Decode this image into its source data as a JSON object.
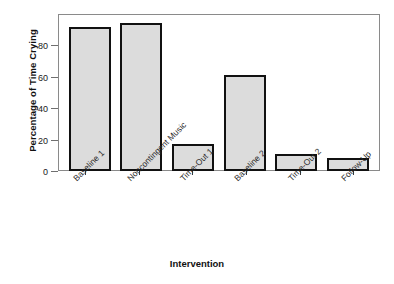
{
  "chart_data": {
    "type": "bar",
    "title": "",
    "xlabel": "Intervention",
    "ylabel": "Percentage of Time Crying",
    "categories": [
      "Baseline 1",
      "Noncontingent Music",
      "Time-Out 1",
      "Baseline 2",
      "Time-Out 2",
      "Follow-Up"
    ],
    "values": [
      92,
      94,
      17,
      61,
      11,
      8
    ],
    "ylim": [
      0,
      100
    ],
    "yticks": [
      0,
      20,
      40,
      60,
      80
    ],
    "ytick_labels": [
      "0",
      "20",
      "40",
      "60",
      "80"
    ],
    "grid": false,
    "legend": false,
    "bar_fill_color": "#dcdcdc",
    "bar_edge_color": "#111111",
    "frame_color": "#8a8a8a",
    "background_color": "#ffffff"
  },
  "axes": {
    "y_title": "Percentage of Time Crying",
    "x_title": "Intervention"
  }
}
